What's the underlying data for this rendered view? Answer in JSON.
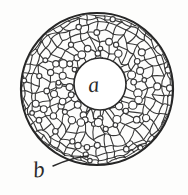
{
  "figure": {
    "kind": "scientific-line-drawing",
    "background_color": "#fdfdfc",
    "ink_color": "#2b2b2b",
    "canvas": {
      "width": 188,
      "height": 195
    }
  },
  "sphere": {
    "center_x": 97,
    "center_y": 89,
    "radius": 76,
    "outline_color": "#262626",
    "outline_width": 2.2
  },
  "central_region": {
    "label": "a",
    "center_x": 100,
    "center_y": 84,
    "radius": 26,
    "outline_color": "#2b2b2b",
    "outline_width": 1.6,
    "fill": "#ffffff"
  },
  "labels": [
    {
      "id": "label-a",
      "text": "a",
      "x": 88,
      "y": 74
    },
    {
      "id": "label-b",
      "text": "b",
      "x": 33,
      "y": 158
    }
  ],
  "leader_line": {
    "from_label": "b",
    "start_x": 53,
    "start_y": 166,
    "end_x": 88,
    "end_y": 156,
    "color": "#2b2b2b",
    "width": 1.4
  },
  "mesh": {
    "description": "irregular polygonal cell network drawn in perspective over a sphere",
    "cell_line_color": "#3a3a3a",
    "cell_line_width": 1.1,
    "node_circle_color": "#3a3a3a",
    "node_circle_radius_range": [
      2.2,
      4.2
    ],
    "inner_ring_count": 26,
    "mid_ring_count": 34,
    "outer_ring_count": 42,
    "rim_ring_count": 52
  }
}
